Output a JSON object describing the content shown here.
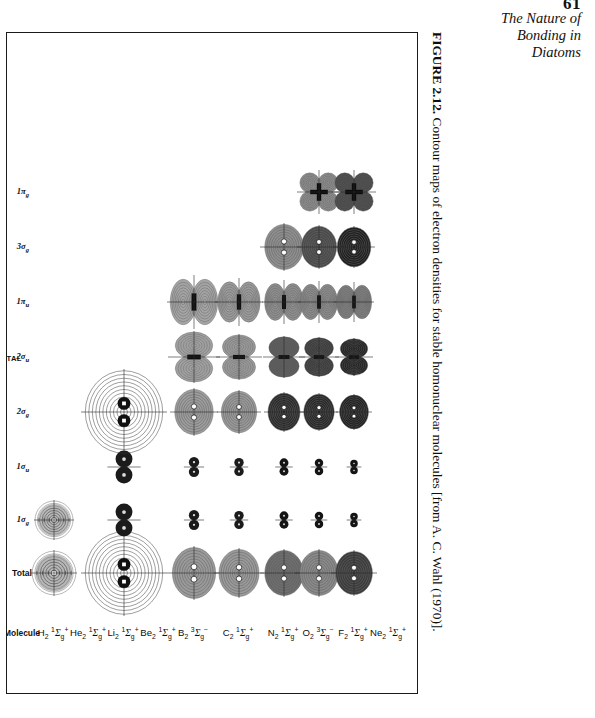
{
  "page": {
    "number": "61",
    "running_head_lines": [
      "The Nature of",
      "Bonding in",
      "Diatoms"
    ]
  },
  "caption": {
    "figure_number": "FIGURE 2.12.",
    "text": " Contour maps of electron densities for stable homonuclear molecules [from A. C. Wahl (1970)]."
  },
  "table": {
    "group_label": "MOLECULAR ORBITAL",
    "molecule_column_header": "Molecule",
    "column_headers": [
      "Total",
      "1σg",
      "1σu",
      "2σg",
      "2σu",
      "1πu",
      "3σg",
      "1πg"
    ],
    "columns": [
      {
        "id": "total",
        "label_main": "Total",
        "label_sub": "",
        "italic": false
      },
      {
        "id": "1sg",
        "label_main": "1σ",
        "label_sub": "g",
        "italic": true
      },
      {
        "id": "1su",
        "label_main": "1σ",
        "label_sub": "u",
        "italic": true
      },
      {
        "id": "2sg",
        "label_main": "2σ",
        "label_sub": "g",
        "italic": true
      },
      {
        "id": "2su",
        "label_main": "2σ",
        "label_sub": "u",
        "italic": true
      },
      {
        "id": "1pu",
        "label_main": "1π",
        "label_sub": "u",
        "italic": true
      },
      {
        "id": "3sg",
        "label_main": "3σ",
        "label_sub": "g",
        "italic": true
      },
      {
        "id": "1pg",
        "label_main": "1π",
        "label_sub": "g",
        "italic": true
      }
    ],
    "rows": [
      {
        "id": "h2",
        "formula": "H",
        "n": "2",
        "term_sup_left": "1",
        "term": "Σ",
        "term_sub": "g",
        "term_sup": "+"
      },
      {
        "id": "he2",
        "formula": "He",
        "n": "2",
        "term_sup_left": "1",
        "term": "Σ",
        "term_sub": "g",
        "term_sup": "+"
      },
      {
        "id": "li2",
        "formula": "Li",
        "n": "2",
        "term_sup_left": "1",
        "term": "Σ",
        "term_sub": "g",
        "term_sup": "+"
      },
      {
        "id": "be2",
        "formula": "Be",
        "n": "2",
        "term_sup_left": "1",
        "term": "Σ",
        "term_sub": "g",
        "term_sup": "+"
      },
      {
        "id": "b2",
        "formula": "B",
        "n": "2",
        "term_sup_left": "3",
        "term": "Σ",
        "term_sub": "g",
        "term_sup": "−"
      },
      {
        "id": "c2",
        "formula": "C",
        "n": "2",
        "term_sup_left": "1",
        "term": "Σ",
        "term_sub": "g",
        "term_sup": "+"
      },
      {
        "id": "n2",
        "formula": "N",
        "n": "2",
        "term_sup_left": "1",
        "term": "Σ",
        "term_sub": "g",
        "term_sup": "+"
      },
      {
        "id": "o2",
        "formula": "O",
        "n": "2",
        "term_sup_left": "3",
        "term": "Σ",
        "term_sub": "g",
        "term_sup": "−"
      },
      {
        "id": "f2",
        "formula": "F",
        "n": "2",
        "term_sup_left": "1",
        "term": "Σ",
        "term_sub": "g",
        "term_sup": "+"
      },
      {
        "id": "ne2",
        "formula": "Ne",
        "n": "2",
        "term_sup_left": "1",
        "term": "Σ",
        "term_sub": "g",
        "term_sup": "+"
      }
    ],
    "cells": [
      {
        "row": "h2",
        "col": "total",
        "kind": "sphere-contour",
        "size": 46,
        "shade": "#8a8a8a"
      },
      {
        "row": "h2",
        "col": "1sg",
        "kind": "sphere-contour",
        "size": 40,
        "shade": "#8f8f8f"
      },
      {
        "row": "li2",
        "col": "total",
        "kind": "bigcontour-pair",
        "size": 86,
        "shade": "#ffffff"
      },
      {
        "row": "li2",
        "col": "1sg",
        "kind": "dumbbell-solid",
        "size": 36,
        "shade": "#1b1b1b"
      },
      {
        "row": "li2",
        "col": "1su",
        "kind": "dumbbell-solid",
        "size": 36,
        "shade": "#1b1b1b"
      },
      {
        "row": "li2",
        "col": "2sg",
        "kind": "bigcontour-pair",
        "size": 86,
        "shade": "#ffffff"
      },
      {
        "row": "b2",
        "col": "total",
        "kind": "oval-shaded",
        "size": 54,
        "shade": "#9a9a9a"
      },
      {
        "row": "b2",
        "col": "1sg",
        "kind": "dumbbell-small",
        "size": 22,
        "shade": "#1b1b1b"
      },
      {
        "row": "b2",
        "col": "1su",
        "kind": "dumbbell-small",
        "size": 22,
        "shade": "#1b1b1b"
      },
      {
        "row": "b2",
        "col": "2sg",
        "kind": "oval-shaded",
        "size": 48,
        "shade": "#9d9d9d"
      },
      {
        "row": "b2",
        "col": "2su",
        "kind": "bilobe-updown",
        "size": 52,
        "shade": "#a0a0a0"
      },
      {
        "row": "b2",
        "col": "1pu",
        "kind": "bilobe-lr",
        "size": 54,
        "shade": "#a5a5a5"
      },
      {
        "row": "c2",
        "col": "total",
        "kind": "oval-shaded",
        "size": 50,
        "shade": "#9a9a9a"
      },
      {
        "row": "c2",
        "col": "1sg",
        "kind": "dumbbell-small",
        "size": 20,
        "shade": "#1b1b1b"
      },
      {
        "row": "c2",
        "col": "1su",
        "kind": "dumbbell-small",
        "size": 20,
        "shade": "#1b1b1b"
      },
      {
        "row": "c2",
        "col": "2sg",
        "kind": "oval-shaded",
        "size": 44,
        "shade": "#9a9a9a"
      },
      {
        "row": "c2",
        "col": "2su",
        "kind": "bilobe-updown",
        "size": 46,
        "shade": "#999999"
      },
      {
        "row": "c2",
        "col": "1pu",
        "kind": "bilobe-lr",
        "size": 48,
        "shade": "#9b9b9b"
      },
      {
        "row": "n2",
        "col": "total",
        "kind": "oval-shaded",
        "size": 48,
        "shade": "#6e6e6e"
      },
      {
        "row": "n2",
        "col": "1sg",
        "kind": "dumbbell-small",
        "size": 19,
        "shade": "#141414"
      },
      {
        "row": "n2",
        "col": "1su",
        "kind": "dumbbell-small",
        "size": 19,
        "shade": "#141414"
      },
      {
        "row": "n2",
        "col": "2sg",
        "kind": "oval-dark",
        "size": 40,
        "shade": "#2a2a2a"
      },
      {
        "row": "n2",
        "col": "2su",
        "kind": "bilobe-updown",
        "size": 42,
        "shade": "#5a5a5a"
      },
      {
        "row": "n2",
        "col": "1pu",
        "kind": "bilobe-lr",
        "size": 44,
        "shade": "#8f8f8f"
      },
      {
        "row": "n2",
        "col": "3sg",
        "kind": "oval-shaded",
        "size": 48,
        "shade": "#8f8f8f"
      },
      {
        "row": "o2",
        "col": "total",
        "kind": "oval-shaded",
        "size": 48,
        "shade": "#8a8a8a"
      },
      {
        "row": "o2",
        "col": "1sg",
        "kind": "dumbbell-small",
        "size": 18,
        "shade": "#141414"
      },
      {
        "row": "o2",
        "col": "1su",
        "kind": "dumbbell-small",
        "size": 18,
        "shade": "#141414"
      },
      {
        "row": "o2",
        "col": "2sg",
        "kind": "oval-dark",
        "size": 38,
        "shade": "#262626"
      },
      {
        "row": "o2",
        "col": "2su",
        "kind": "bilobe-updown",
        "size": 40,
        "shade": "#3c3c3c"
      },
      {
        "row": "o2",
        "col": "1pu",
        "kind": "bilobe-lr",
        "size": 42,
        "shade": "#8c8c8c"
      },
      {
        "row": "o2",
        "col": "3sg",
        "kind": "oval-dark",
        "size": 44,
        "shade": "#4a4a4a"
      },
      {
        "row": "o2",
        "col": "1pg",
        "kind": "quatrefoil",
        "size": 44,
        "shade": "#8d8d8d"
      },
      {
        "row": "f2",
        "col": "total",
        "kind": "oval-dark",
        "size": 46,
        "shade": "#3c3c3c"
      },
      {
        "row": "f2",
        "col": "1sg",
        "kind": "dumbbell-small",
        "size": 16,
        "shade": "#141414"
      },
      {
        "row": "f2",
        "col": "1su",
        "kind": "dumbbell-small",
        "size": 16,
        "shade": "#141414"
      },
      {
        "row": "f2",
        "col": "2sg",
        "kind": "oval-dark",
        "size": 36,
        "shade": "#1e1e1e"
      },
      {
        "row": "f2",
        "col": "2su",
        "kind": "bilobe-updown",
        "size": 38,
        "shade": "#242424"
      },
      {
        "row": "f2",
        "col": "1pu",
        "kind": "bilobe-lr",
        "size": 40,
        "shade": "#7f7f7f"
      },
      {
        "row": "f2",
        "col": "3sg",
        "kind": "oval-dark",
        "size": 42,
        "shade": "#1f1f1f"
      },
      {
        "row": "f2",
        "col": "1pg",
        "kind": "quatrefoil",
        "size": 44,
        "shade": "#4a4a4a"
      }
    ]
  },
  "colors": {
    "ink": "#121212",
    "frame": "#1a1a1a",
    "paper": "#ffffff"
  }
}
